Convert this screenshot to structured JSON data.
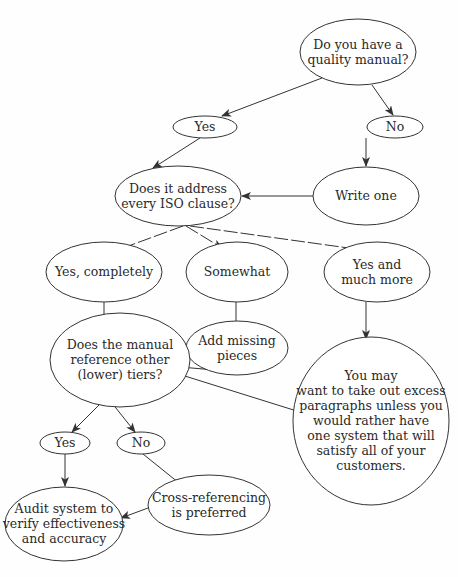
{
  "diagram": {
    "type": "flowchart",
    "colors": {
      "line": "#333333",
      "text": "#2a2a2a",
      "background": "#ffffff"
    },
    "nodes": [
      {
        "id": "q_manual",
        "lines": [
          "Do you have a",
          "quality manual?"
        ],
        "cx": 358,
        "cy": 52,
        "rx": 58,
        "ry": 33
      },
      {
        "id": "yes1",
        "lines": [
          "Yes"
        ],
        "cx": 205,
        "cy": 127,
        "rx": 32,
        "ry": 11
      },
      {
        "id": "no1",
        "lines": [
          "No"
        ],
        "cx": 395,
        "cy": 127,
        "rx": 28,
        "ry": 11
      },
      {
        "id": "q_iso",
        "lines": [
          "Does it address",
          "every ISO clause?"
        ],
        "cx": 178,
        "cy": 196,
        "rx": 63,
        "ry": 30
      },
      {
        "id": "write_one",
        "lines": [
          "Write one"
        ],
        "cx": 366,
        "cy": 196,
        "rx": 53,
        "ry": 29
      },
      {
        "id": "yes_completely",
        "lines": [
          "Yes, completely"
        ],
        "cx": 104,
        "cy": 272,
        "rx": 58,
        "ry": 30
      },
      {
        "id": "somewhat",
        "lines": [
          "Somewhat"
        ],
        "cx": 237,
        "cy": 272,
        "rx": 51,
        "ry": 30
      },
      {
        "id": "yes_more",
        "lines": [
          "Yes and",
          "much more"
        ],
        "cx": 377,
        "cy": 272,
        "rx": 53,
        "ry": 30
      },
      {
        "id": "add_missing",
        "lines": [
          "Add missing",
          "pieces"
        ],
        "cx": 237,
        "cy": 348,
        "rx": 51,
        "ry": 27
      },
      {
        "id": "q_reference",
        "lines": [
          "Does the manual",
          "reference other",
          "(lower) tiers?"
        ],
        "cx": 120,
        "cy": 360,
        "rx": 70,
        "ry": 47
      },
      {
        "id": "take_out",
        "lines": [
          "You may",
          "want to take out excess",
          "paragraphs unless you",
          "would rather have",
          "one system that will",
          "satisfy all of your",
          "customers."
        ],
        "cx": 371,
        "cy": 421,
        "rx": 78,
        "ry": 84
      },
      {
        "id": "yes2",
        "lines": [
          "Yes"
        ],
        "cx": 65,
        "cy": 443,
        "rx": 25,
        "ry": 11
      },
      {
        "id": "no2",
        "lines": [
          "No"
        ],
        "cx": 141,
        "cy": 443,
        "rx": 24,
        "ry": 11
      },
      {
        "id": "audit",
        "lines": [
          "Audit system to",
          "verify effectiveness",
          "and accuracy"
        ],
        "cx": 64,
        "cy": 524,
        "rx": 59,
        "ry": 37
      },
      {
        "id": "cross_ref",
        "lines": [
          "Cross-referencing",
          "is preferred"
        ],
        "cx": 209,
        "cy": 505,
        "rx": 61,
        "ry": 30
      }
    ],
    "edges": [
      {
        "from": "q_manual",
        "to": "yes1",
        "x1": 322,
        "y1": 78,
        "x2": 222,
        "y2": 116
      },
      {
        "from": "q_manual",
        "to": "no1",
        "x1": 372,
        "y1": 85,
        "x2": 393,
        "y2": 115
      },
      {
        "from": "yes1",
        "to": "q_iso",
        "x1": 200,
        "y1": 138,
        "x2": 153,
        "y2": 168
      },
      {
        "from": "no1",
        "to": "write_one",
        "x1": 366,
        "y1": 138,
        "x2": 366,
        "y2": 166
      },
      {
        "from": "write_one",
        "to": "q_iso",
        "x1": 313,
        "y1": 196,
        "x2": 242,
        "y2": 196
      },
      {
        "from": "q_iso",
        "to": "yes_completely",
        "x1": 183,
        "y1": 226,
        "x2": 112,
        "y2": 252,
        "dashed": true
      },
      {
        "from": "q_iso",
        "to": "somewhat",
        "x1": 186,
        "y1": 226,
        "x2": 222,
        "y2": 248,
        "dashed": true
      },
      {
        "from": "q_iso",
        "to": "yes_more",
        "x1": 190,
        "y1": 226,
        "x2": 363,
        "y2": 250,
        "dashed": true
      },
      {
        "from": "yes_completely",
        "to": "q_reference",
        "x1": 104,
        "y1": 302,
        "x2": 104,
        "y2": 329
      },
      {
        "from": "somewhat",
        "to": "add_missing",
        "x1": 236,
        "y1": 302,
        "x2": 236,
        "y2": 330
      },
      {
        "from": "yes_more",
        "to": "take_out",
        "x1": 366,
        "y1": 302,
        "x2": 366,
        "y2": 339
      },
      {
        "from": "add_missing",
        "to": "q_reference",
        "x1": 215,
        "y1": 370,
        "x2": 157,
        "y2": 365
      },
      {
        "from": "take_out",
        "to": "q_reference",
        "x1": 300,
        "y1": 412,
        "x2": 156,
        "y2": 367
      },
      {
        "from": "q_reference",
        "to": "yes2",
        "x1": 106,
        "y1": 398,
        "x2": 72,
        "y2": 432
      },
      {
        "from": "q_reference",
        "to": "no2",
        "x1": 108,
        "y1": 398,
        "x2": 135,
        "y2": 432
      },
      {
        "from": "yes2",
        "to": "audit",
        "x1": 65,
        "y1": 454,
        "x2": 65,
        "y2": 486
      },
      {
        "from": "no2",
        "to": "cross_ref",
        "x1": 143,
        "y1": 454,
        "x2": 184,
        "y2": 487
      },
      {
        "from": "cross_ref",
        "to": "audit",
        "x1": 148,
        "y1": 508,
        "x2": 121,
        "y2": 518
      }
    ]
  }
}
